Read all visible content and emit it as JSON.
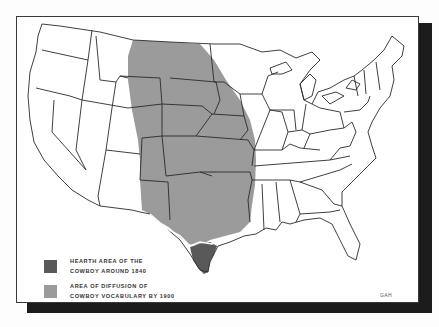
{
  "map": {
    "title": "",
    "subject": "Diffusion of cowboy culture in the United States",
    "colors": {
      "hearth": "#595959",
      "diffusion": "#9b9b9b",
      "outline": "#2a2a2a",
      "background": "#ffffff",
      "shadow": "#1c1c1c"
    }
  },
  "legend": {
    "items": [
      {
        "line1": "HEARTH AREA OF THE",
        "line2": "COWBOY AROUND 1840",
        "color": "#595959"
      },
      {
        "line1": "AREA OF DIFFUSION OF",
        "line2": "COWBOY VOCABULARY BY 1900",
        "color": "#9b9b9b"
      }
    ]
  },
  "credit": "GAH"
}
